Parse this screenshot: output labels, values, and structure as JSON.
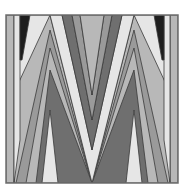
{
  "image": {
    "title": "Abstract zigzag M pattern",
    "description": "Grayscale geometric pattern of nested chevron bands forming an M shape inside a square frame",
    "colors": {
      "background": "#ffffff",
      "frame": "#6e6e6e",
      "black": "#1e1e1e",
      "dark_gray": "#6f6f6f",
      "mid_gray": "#9a9a9a",
      "light_gray": "#b8b8b8",
      "pale": "#e6e6e6",
      "outline": "#3a3a3a"
    }
  }
}
